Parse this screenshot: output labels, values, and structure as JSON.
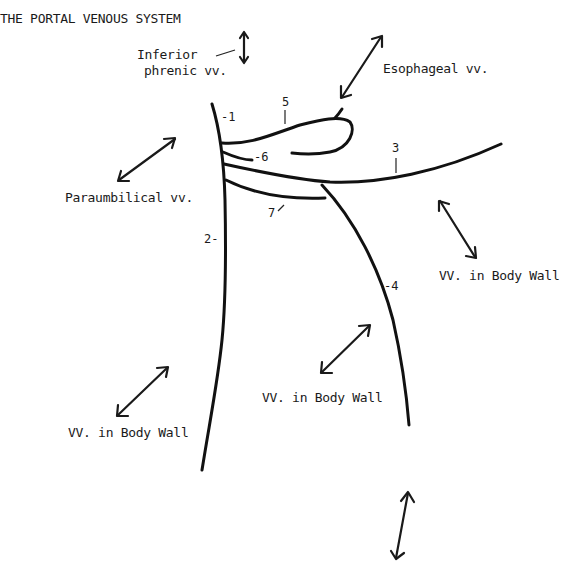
{
  "title": "THE PORTAL VENOUS SYSTEM",
  "labels": {
    "inferior_phrenic_line1": "Inferior",
    "inferior_phrenic_line2": "phrenic vv.",
    "esophageal": "Esophageal vv.",
    "paraumbilical": "Paraumbilical vv.",
    "body_wall_right": "VV. in Body Wall",
    "body_wall_center": "VV. in Body Wall",
    "body_wall_left": "VV. in Body Wall"
  },
  "numbers": {
    "n1": "-1",
    "n2": "2-",
    "n3": "3",
    "n4": "-4",
    "n5": "5",
    "n6": "-6",
    "n7": "7"
  }
}
